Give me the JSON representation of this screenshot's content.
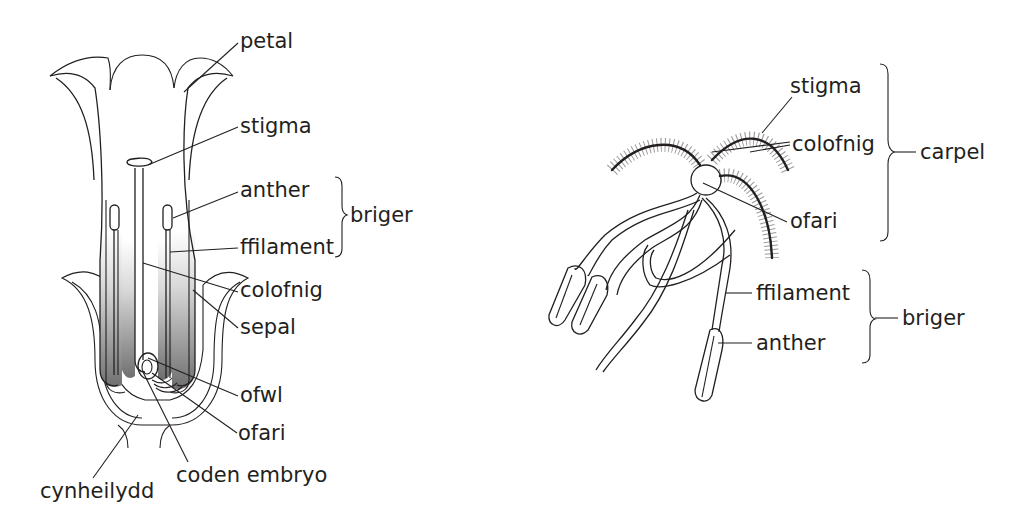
{
  "figure": {
    "left_diagram": {
      "description": "Longitudinal section of a flower (insect-pollinated type)",
      "labels": {
        "petal": "petal",
        "stigma": "stigma",
        "anther": "anther",
        "filament": "ffilament",
        "stamen_group": "briger",
        "style": "colofnig",
        "sepal": "sepal",
        "ovule": "ofwl",
        "ovary": "ofari",
        "embryo_sac": "coden embryo",
        "receptacle": "cynheilydd"
      }
    },
    "right_diagram": {
      "description": "Wind-pollinated flower with feathery stigmas and hanging anthers",
      "labels": {
        "stigma": "stigma",
        "style": "colofnig",
        "ovary": "ofari",
        "carpel_group": "carpel",
        "filament": "ffilament",
        "anther": "anther",
        "stamen_group": "briger"
      }
    },
    "colors": {
      "line": "#231f20",
      "shade_light": "#d6d6d6",
      "shade_dark": "#7a7a7a",
      "anther_fill": "#bdbdbd",
      "background": "#ffffff"
    }
  }
}
